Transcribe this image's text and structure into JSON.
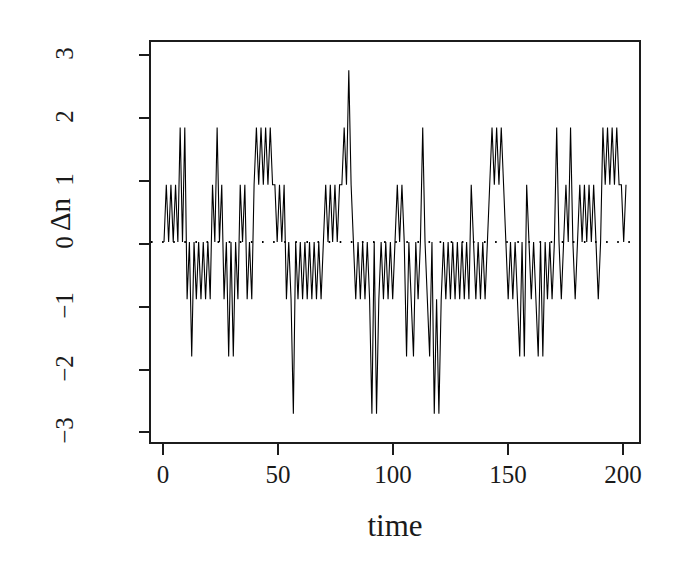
{
  "chart_data": {
    "type": "line",
    "title": "",
    "subtitle": "",
    "xlabel": "time",
    "ylabel": "Δn",
    "xlim": [
      0,
      200
    ],
    "ylim": [
      -3.3,
      3.3
    ],
    "xticks": [
      0,
      50,
      100,
      150,
      200
    ],
    "yticks": [
      3,
      2,
      1,
      0,
      -1,
      -2,
      -3
    ],
    "xtick_labels": [
      "0",
      "50",
      "100",
      "150",
      "200"
    ],
    "ytick_labels": [
      "3",
      "2",
      "1",
      "0",
      "−1",
      "−2",
      "−3"
    ],
    "grid": false,
    "legend": null,
    "legend_position": "none",
    "line_color": "#000000",
    "line_width": 1,
    "reference_line": {
      "name": "zero-line",
      "y": 0,
      "style": "dotted",
      "color": "#000000",
      "width": 2
    },
    "x": [
      0,
      1,
      2,
      3,
      4,
      5,
      6,
      7,
      8,
      9,
      10,
      11,
      12,
      13,
      14,
      15,
      16,
      17,
      18,
      19,
      20,
      21,
      22,
      23,
      24,
      25,
      26,
      27,
      28,
      29,
      30,
      31,
      32,
      33,
      34,
      35,
      36,
      37,
      38,
      39,
      40,
      41,
      42,
      43,
      44,
      45,
      46,
      47,
      48,
      49,
      50,
      51,
      52,
      53,
      54,
      55,
      56,
      57,
      58,
      59,
      60,
      61,
      62,
      63,
      64,
      65,
      66,
      67,
      68,
      69,
      70,
      71,
      72,
      73,
      74,
      75,
      76,
      77,
      78,
      79,
      80,
      81,
      82,
      83,
      84,
      85,
      86,
      87,
      88,
      89,
      90,
      91,
      92,
      93,
      94,
      95,
      96,
      97,
      98,
      99,
      100,
      101,
      102,
      103,
      104,
      105,
      106,
      107,
      108,
      109,
      110,
      111,
      112,
      113,
      114,
      115,
      116,
      117,
      118,
      119,
      120,
      121,
      122,
      123,
      124,
      125,
      126,
      127,
      128,
      129,
      130,
      131,
      132,
      133,
      134,
      135,
      136,
      137,
      138,
      139,
      140,
      141,
      142,
      143,
      144,
      145,
      146,
      147,
      148,
      149,
      150,
      151,
      152,
      153,
      154,
      155,
      156,
      157,
      158,
      159,
      160,
      161,
      162,
      163,
      164,
      165,
      166,
      167,
      168,
      169,
      170,
      171,
      172,
      173,
      174,
      175,
      176,
      177,
      178,
      179,
      180,
      181,
      182,
      183,
      184,
      185,
      186,
      187,
      188,
      189,
      190,
      191,
      192,
      193,
      194,
      195,
      196,
      197,
      198,
      199,
      200
    ],
    "y": [
      0,
      1,
      0,
      1,
      0,
      1,
      0,
      2,
      0,
      2,
      -1,
      0,
      -2,
      0,
      -1,
      0,
      -1,
      0,
      -1,
      0,
      -1,
      1,
      0,
      2,
      0,
      1,
      -1,
      0,
      -2,
      0,
      -2,
      0,
      -1,
      1,
      0,
      1,
      -1,
      0,
      -1,
      1,
      2,
      1,
      2,
      1,
      2,
      1,
      2,
      1,
      1,
      0,
      1,
      0,
      1,
      -1,
      0,
      -1,
      -3,
      0,
      -1,
      0,
      -1,
      0,
      -1,
      0,
      -1,
      0,
      -1,
      0,
      -1,
      0,
      1,
      0,
      1,
      0,
      1,
      0,
      1,
      1,
      2,
      1,
      3,
      1,
      0,
      -1,
      0,
      -1,
      0,
      -1,
      0,
      -1,
      -3,
      0,
      -3,
      -1,
      0,
      -1,
      0,
      -1,
      0,
      -1,
      0,
      1,
      0,
      1,
      0,
      -2,
      0,
      -1,
      -2,
      0,
      -1,
      0,
      2,
      0,
      -1,
      -2,
      0,
      -3,
      -1,
      -3,
      -1,
      0,
      -1,
      0,
      -1,
      0,
      -1,
      0,
      -1,
      0,
      -1,
      0,
      -1,
      1,
      0,
      -1,
      0,
      -1,
      0,
      -1,
      0,
      1,
      2,
      1,
      2,
      1,
      2,
      1,
      0,
      -1,
      0,
      -1,
      0,
      -1,
      -2,
      0,
      -2,
      1,
      0,
      -1,
      0,
      -1,
      -2,
      0,
      -2,
      0,
      -1,
      0,
      -1,
      0,
      2,
      0,
      -1,
      0,
      1,
      0,
      2,
      0,
      -1,
      0,
      1,
      0,
      1,
      0,
      1,
      0,
      1,
      0,
      -1,
      0,
      2,
      1,
      2,
      1,
      2,
      1,
      2,
      1,
      1,
      0,
      1,
      0,
      1,
      0,
      1,
      0,
      1,
      0,
      0
    ]
  }
}
